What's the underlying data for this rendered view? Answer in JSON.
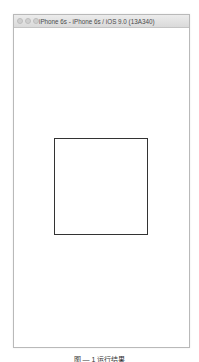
{
  "window": {
    "title": "iPhone 6s - iPhone 6s / iOS 9.0 (13A340)",
    "traffic_lights": [
      "close",
      "minimize",
      "zoom"
    ]
  },
  "screen": {
    "background": "#ffffff",
    "square": {
      "border_color": "#333333",
      "fill": "#ffffff"
    }
  },
  "caption": "图 — 1 运行结果"
}
